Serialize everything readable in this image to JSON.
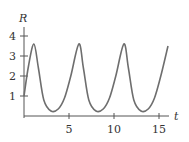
{
  "chart_data": {
    "type": "line",
    "title": "",
    "xlabel": "t",
    "ylabel": "R",
    "xlim": [
      0,
      16
    ],
    "ylim": [
      0,
      4.2
    ],
    "grid": false,
    "legend": null,
    "x_ticks": [
      5,
      10,
      15
    ],
    "x_tick_labels": [
      "5",
      "10",
      "15"
    ],
    "y_ticks": [
      1,
      2,
      3,
      4
    ],
    "y_tick_labels": [
      "1",
      "2",
      "3",
      "4"
    ],
    "series": [
      {
        "name": "R(t)",
        "color": "#6e6e6e",
        "x": [
          0,
          0.5,
          1.1,
          1.6,
          2.2,
          3.0,
          3.8,
          4.5,
          5.2,
          6.1,
          6.6,
          7.2,
          8.0,
          8.8,
          9.5,
          10.2,
          11.1,
          11.6,
          12.2,
          13.0,
          13.8,
          14.5,
          15.2,
          16.0
        ],
        "values": [
          1.0,
          2.5,
          3.6,
          2.4,
          0.8,
          0.25,
          0.35,
          0.9,
          2.0,
          3.6,
          2.4,
          0.8,
          0.25,
          0.35,
          0.9,
          2.0,
          3.6,
          2.4,
          0.8,
          0.25,
          0.35,
          0.9,
          2.0,
          3.5
        ]
      }
    ]
  },
  "axes": {
    "x_label": "t",
    "y_label": "R"
  }
}
